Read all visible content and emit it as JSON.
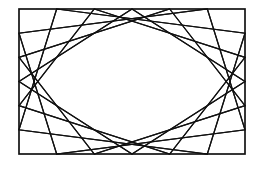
{
  "figure": {
    "description": "Inscribed rotating quadrilaterals forming an elliptical envelope inside a rectangle",
    "stroke_color": "#111111",
    "background": "#ffffff",
    "rect": {
      "x": 19,
      "y": 9,
      "width": 226,
      "height": 145
    },
    "fractions": [
      0.1667,
      0.3333,
      0.5,
      0.6667,
      0.8333
    ],
    "stroke_width": 1.2
  }
}
